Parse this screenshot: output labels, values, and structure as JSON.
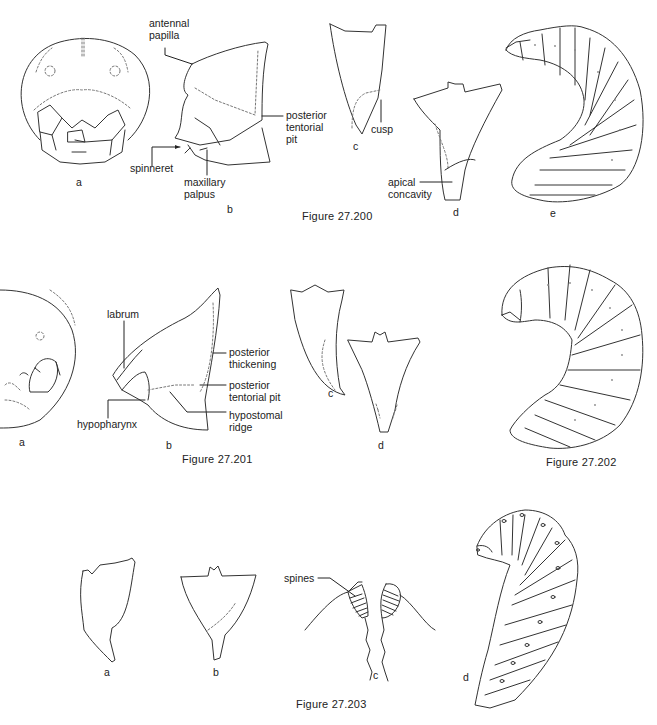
{
  "figures": [
    {
      "id": "fig-27-200",
      "caption": "Figure 27.200",
      "panels": {
        "a": "a",
        "b": "b",
        "c": "c",
        "d": "d",
        "e": "e"
      },
      "labels": {
        "antennal_papilla": [
          "antennal",
          "papilla"
        ],
        "posterior_tentorial_pit": [
          "posterior",
          "tentorial",
          "pit"
        ],
        "spinneret": "spinneret",
        "maxillary_palpus": [
          "maxillary",
          "palpus"
        ],
        "cusp": "cusp",
        "apical_concavity": [
          "apical",
          "concavity"
        ]
      }
    },
    {
      "id": "fig-27-201",
      "caption": "Figure 27.201",
      "panels": {
        "a": "a",
        "b": "b",
        "c": "c",
        "d": "d"
      },
      "labels": {
        "labrum": "labrum",
        "posterior_thickening": [
          "posterior",
          "thickening"
        ],
        "posterior_tentorial_pit": [
          "posterior",
          "tentorial pit"
        ],
        "hypostomal_ridge": [
          "hypostomal",
          "ridge"
        ],
        "hypopharynx": "hypopharynx"
      }
    },
    {
      "id": "fig-27-202",
      "caption": "Figure 27.202"
    },
    {
      "id": "fig-27-203",
      "caption": "Figure 27.203",
      "panels": {
        "a": "a",
        "b": "b",
        "c": "c",
        "d": "d"
      },
      "labels": {
        "spines": "spines"
      }
    }
  ]
}
